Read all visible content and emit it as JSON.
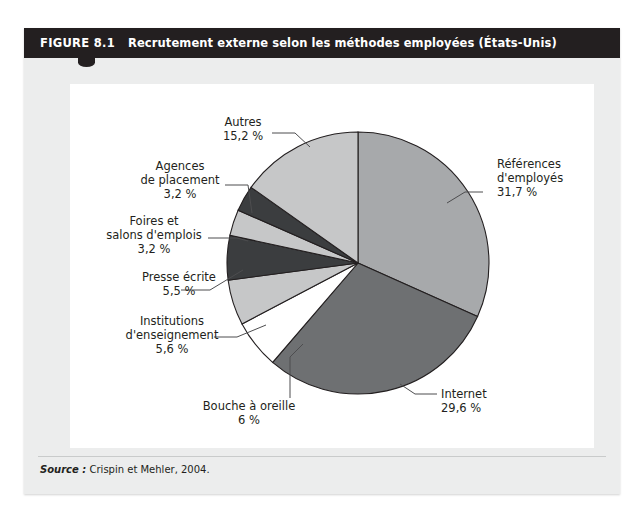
{
  "figure": {
    "label": "FIGURE 8.1",
    "title": "Recrutement externe selon les méthodes employées (États-Unis)",
    "source_label": "Source :",
    "source_text": "Crispin et Mehler, 2004."
  },
  "colors": {
    "title_bar": "#231f20",
    "panel_background": "#eceded",
    "canvas": "#ffffff",
    "outline": "#231f20",
    "leader": "#4d4d4f",
    "slice_light_gray": "#c6c7c8",
    "slice_mid_gray": "#a7a9ab",
    "slice_dark_gray": "#6e7072",
    "slice_darkest": "#3b3d3f",
    "slice_white": "#ffffff"
  },
  "chart_data": {
    "type": "pie",
    "title": "Recrutement externe selon les méthodes employées (États-Unis)",
    "start_angle_deg": 0,
    "direction": "clockwise",
    "legend": "labels-with-leader-lines",
    "center": {
      "x": 358,
      "y": 263
    },
    "radius": 131,
    "slices": [
      {
        "label": "Références d'employés",
        "value": 31.7,
        "value_text": "31,7 %",
        "color": "#a7a9ab",
        "label_x": 497,
        "label_y": 168,
        "label_anchor": "start",
        "lines": [
          "Références",
          "d'employés",
          "31,7 %"
        ],
        "leader": "M 483,192 L 465,192 L 447,203"
      },
      {
        "label": "Internet",
        "value": 29.6,
        "value_text": "29,6 %",
        "color": "#6e7072",
        "label_x": 441,
        "label_y": 398,
        "label_anchor": "start",
        "lines": [
          "Internet",
          "29,6 %"
        ],
        "leader": "M 437,394 L 415,394 L 400,384"
      },
      {
        "label": "Bouche à oreille",
        "value": 6.0,
        "value_text": "6 %",
        "color": "#ffffff",
        "label_x": 249,
        "label_y": 410,
        "label_anchor": "middle",
        "lines": [
          "Bouche à oreille",
          "6 %"
        ],
        "leader": "M 290,398 L 290,357 L 303,344"
      },
      {
        "label": "Institutions d'enseignement",
        "value": 5.6,
        "value_text": "5,6 %",
        "color": "#c6c7c8",
        "label_x": 172,
        "label_y": 325,
        "label_anchor": "middle",
        "lines": [
          "Institutions",
          "d'enseignement",
          "5,6 %"
        ],
        "leader": "M 214,337 L 237,337 L 266,325"
      },
      {
        "label": "Presse écrite",
        "value": 5.5,
        "value_text": "5,5 %",
        "color": "#3b3d3f",
        "label_x": 179,
        "label_y": 281,
        "label_anchor": "middle",
        "lines": [
          "Presse écrite",
          "5,5 %"
        ],
        "leader": "M 181,290 L 210,290 L 243,270"
      },
      {
        "label": "Foires et salons d'emplois",
        "value": 3.2,
        "value_text": "3,2 %",
        "color": "#c6c7c8",
        "label_x": 154,
        "label_y": 225,
        "label_anchor": "middle",
        "lines": [
          "Foires et",
          "salons d'emplois",
          "3,2 %"
        ],
        "leader": "M 208,238 L 237,238 L 248,241"
      },
      {
        "label": "Agences de placement",
        "value": 3.2,
        "value_text": "3,2 %",
        "color": "#3b3d3f",
        "label_x": 180,
        "label_y": 170,
        "label_anchor": "middle",
        "lines": [
          "Agences",
          "de placement",
          "3,2 %"
        ],
        "leader": "M 225,185 L 248,185 L 252,213"
      },
      {
        "label": "Autres",
        "value": 15.2,
        "value_text": "15,2 %",
        "color": "#c6c7c8",
        "label_x": 243,
        "label_y": 126,
        "label_anchor": "middle",
        "lines": [
          "Autres",
          "15,2 %"
        ],
        "leader": "M 272,133 L 295,133 L 310,147"
      }
    ]
  }
}
